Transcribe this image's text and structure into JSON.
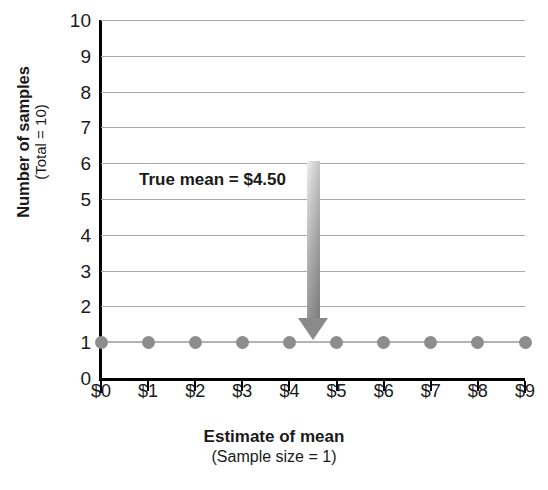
{
  "chart_data": {
    "type": "scatter",
    "title": "",
    "xlabel": "Estimate of mean",
    "xlabel_sub": "(Sample size = 1)",
    "ylabel": "Number of samples",
    "ylabel_sub": "(Total = 10)",
    "categories": [
      "$0",
      "$1",
      "$2",
      "$3",
      "$4",
      "$5",
      "$6",
      "$7",
      "$8",
      "$9"
    ],
    "x": [
      0,
      1,
      2,
      3,
      4,
      5,
      6,
      7,
      8,
      9
    ],
    "values": [
      1,
      1,
      1,
      1,
      1,
      1,
      1,
      1,
      1,
      1
    ],
    "ylim": [
      0,
      10
    ],
    "xlim": [
      0,
      9
    ],
    "ytick_labels": [
      "0",
      "1",
      "2",
      "3",
      "4",
      "5",
      "6",
      "7",
      "8",
      "9",
      "10"
    ],
    "yticks": [
      0,
      1,
      2,
      3,
      4,
      5,
      6,
      7,
      8,
      9,
      10
    ],
    "grid": true,
    "grid_axis": "y",
    "legend": "none",
    "annotations": [
      {
        "text": "True mean  =  $4.50",
        "value": 4.5,
        "marker": "down-arrow",
        "points_to_x": "$4.50",
        "points_to_y": 1
      }
    ],
    "series_color": "#8d8d8d",
    "grid_color": "#a9a9a9",
    "axis_color": "#000000",
    "arrow_color": "#8a8a8a"
  },
  "axes": {
    "y_title_main": "Number of samples",
    "y_title_sub": "(Total = 10)",
    "x_title_main": "Estimate of mean",
    "x_title_sub": "(Sample size = 1)"
  },
  "annotation": {
    "label": "True mean  =  $4.50"
  }
}
